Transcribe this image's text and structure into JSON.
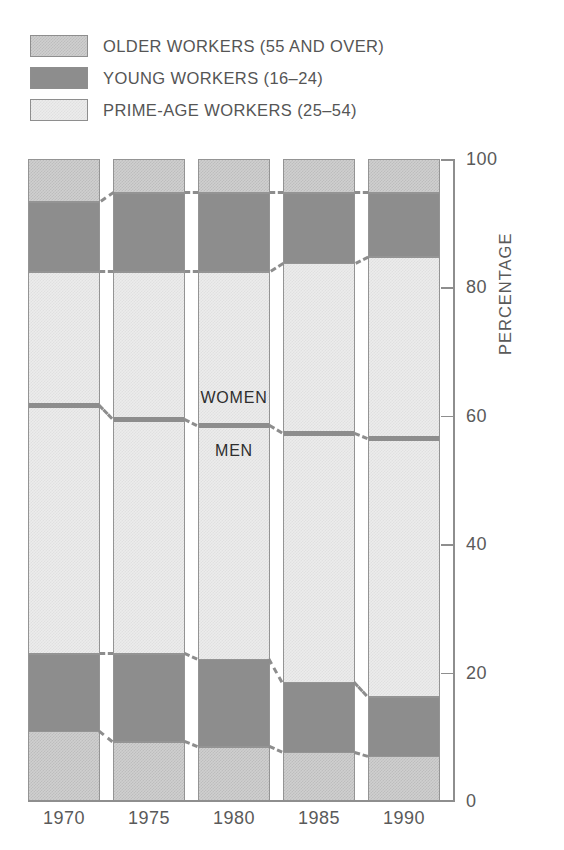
{
  "legend": {
    "items": [
      {
        "label": "OLDER WORKERS (55 AND OVER)",
        "swatch": "older-workers-swatch",
        "color": "#cfcfcf"
      },
      {
        "label": "YOUNG WORKERS (16–24)",
        "swatch": "young-workers-swatch",
        "color": "#8d8d8d"
      },
      {
        "label": "PRIME-AGE WORKERS (25–54)",
        "swatch": "prime-age-workers-swatch",
        "color": "#ececec"
      }
    ]
  },
  "axes": {
    "y_title": "PERCENTAGE",
    "y_ticks": [
      "0",
      "20",
      "40",
      "60",
      "80",
      "100"
    ],
    "x_ticks": [
      "1970",
      "1975",
      "1980",
      "1985",
      "1990"
    ]
  },
  "annotations": {
    "women": "WOMEN",
    "men": "MEN"
  },
  "chart_data": {
    "type": "bar",
    "title": "",
    "subtitle": "",
    "xlabel": "",
    "ylabel": "PERCENTAGE",
    "ylim": [
      0,
      100
    ],
    "yticks": [
      0,
      20,
      40,
      60,
      80,
      100
    ],
    "grid": false,
    "stacked": true,
    "legend_position": "top-left",
    "categories": [
      "1970",
      "1975",
      "1980",
      "1985",
      "1990"
    ],
    "series": [
      {
        "name": "OLDER WORKERS (55 AND OVER)",
        "stack_position": "bottom",
        "color": "#cfcfcf",
        "values": [
          11.1,
          9.5,
          8.7,
          7.8,
          7.2
        ]
      },
      {
        "name": "YOUNG WORKERS (16–24)",
        "stack_position": "lower-middle",
        "color": "#8d8d8d",
        "values": [
          12.1,
          13.7,
          13.6,
          10.9,
          9.3
        ]
      },
      {
        "name": "PRIME-AGE WORKERS (25–54)",
        "stack_position": "middle",
        "color": "#ececec",
        "values": [
          59.5,
          59.5,
          60.4,
          65.3,
          68.5
        ]
      },
      {
        "name": "YOUNG WORKERS (16–24)",
        "stack_position": "upper-middle",
        "color": "#8d8d8d",
        "values": [
          10.9,
          12.3,
          12.3,
          11.0,
          10.0
        ]
      },
      {
        "name": "OLDER WORKERS (55 AND OVER)",
        "stack_position": "top",
        "color": "#cfcfcf",
        "values": [
          6.4,
          5.0,
          5.0,
          5.0,
          5.0
        ]
      }
    ],
    "cumulative_boundaries": {
      "note": "Cumulative percentage from bottom of each stacked bar",
      "older_bottom_top": [
        11.1,
        9.5,
        8.7,
        7.8,
        7.2
      ],
      "young_bottom_top": [
        23.2,
        23.2,
        22.3,
        18.7,
        16.5
      ],
      "men_women_divider": [
        61.8,
        59.7,
        58.7,
        57.5,
        56.7
      ],
      "prime_top": [
        82.7,
        82.7,
        82.7,
        84.0,
        85.0
      ],
      "young_top_top": [
        93.6,
        95.0,
        95.0,
        95.0,
        95.0
      ]
    },
    "annotations": [
      {
        "text": "WOMEN",
        "at_category": "1980",
        "region": "above men-women divider"
      },
      {
        "text": "MEN",
        "at_category": "1980",
        "region": "below men-women divider"
      }
    ]
  }
}
